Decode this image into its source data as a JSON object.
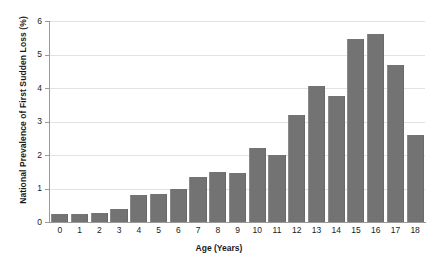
{
  "chart_data": {
    "type": "bar",
    "title": "",
    "xlabel": "Age (Years)",
    "ylabel": "National Prevalence of First Sudden Loss (%)",
    "categories": [
      "0",
      "1",
      "2",
      "3",
      "4",
      "5",
      "6",
      "7",
      "8",
      "9",
      "10",
      "11",
      "12",
      "13",
      "14",
      "15",
      "16",
      "17",
      "18"
    ],
    "values": [
      0.25,
      0.25,
      0.28,
      0.4,
      0.8,
      0.85,
      1.0,
      1.35,
      1.5,
      1.45,
      2.2,
      2.0,
      3.2,
      4.05,
      3.75,
      5.45,
      5.6,
      4.7,
      2.6
    ],
    "ylim": [
      0,
      6
    ],
    "yticks": [
      "0",
      "1",
      "2",
      "3",
      "4",
      "5",
      "6"
    ],
    "grid": true,
    "legend": false,
    "bar_color": "#737373",
    "grid_color": "#e2e2e2",
    "axis_color": "#9a9a9a"
  }
}
